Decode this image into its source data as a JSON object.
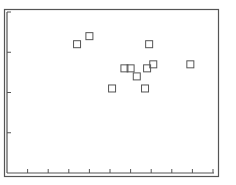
{
  "chart_data": {
    "type": "scatter",
    "title": "",
    "xlabel": "",
    "ylabel": "",
    "xlim": [
      0,
      10
    ],
    "ylim": [
      0,
      4
    ],
    "x_ticks": [
      0,
      1,
      2,
      3,
      4,
      5,
      6,
      7,
      8,
      9,
      10
    ],
    "y_ticks": [
      0,
      1,
      2,
      3,
      4
    ],
    "tick_labels_shown": false,
    "grid": false,
    "legend": null,
    "marker": "open-square",
    "series": [
      {
        "name": "points",
        "points": [
          {
            "x": 3.4,
            "y": 3.2
          },
          {
            "x": 4.0,
            "y": 3.4
          },
          {
            "x": 6.9,
            "y": 3.2
          },
          {
            "x": 5.7,
            "y": 2.6
          },
          {
            "x": 6.0,
            "y": 2.6
          },
          {
            "x": 6.3,
            "y": 2.4
          },
          {
            "x": 6.8,
            "y": 2.6
          },
          {
            "x": 7.1,
            "y": 2.7
          },
          {
            "x": 5.1,
            "y": 2.1
          },
          {
            "x": 6.7,
            "y": 2.1
          },
          {
            "x": 8.9,
            "y": 2.7
          }
        ]
      }
    ]
  },
  "style": {
    "axis_color": "#555555",
    "marker_color": "#555555",
    "background": "#ffffff"
  }
}
